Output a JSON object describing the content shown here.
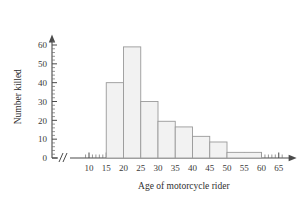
{
  "chart_data": {
    "type": "bar",
    "title": "",
    "xlabel": "Age of motorcycle rider",
    "ylabel": "Number killed",
    "categories": [
      "15-20",
      "20-25",
      "25-30",
      "30-35",
      "35-40",
      "40-45",
      "45-50",
      "50-60"
    ],
    "bins": [
      {
        "start": 15,
        "end": 20,
        "value": 40
      },
      {
        "start": 20,
        "end": 25,
        "value": 59
      },
      {
        "start": 25,
        "end": 30,
        "value": 30
      },
      {
        "start": 30,
        "end": 35,
        "value": 19.5
      },
      {
        "start": 35,
        "end": 40,
        "value": 16.5
      },
      {
        "start": 40,
        "end": 45,
        "value": 11.5
      },
      {
        "start": 45,
        "end": 50,
        "value": 8.5
      },
      {
        "start": 50,
        "end": 60,
        "value": 3
      }
    ],
    "values": [
      40,
      59,
      30,
      19.5,
      16.5,
      11.5,
      8.5,
      3
    ],
    "xlim": [
      8,
      67
    ],
    "ylim": [
      0,
      64
    ],
    "x_ticks": [
      10,
      15,
      20,
      25,
      30,
      35,
      40,
      45,
      50,
      55,
      60,
      65
    ],
    "x_tick_labels": [
      "10",
      "15",
      "20",
      "25",
      "30",
      "35",
      "40",
      "45",
      "50",
      "55",
      "60",
      "65"
    ],
    "x_minor_step": 1,
    "y_ticks": [
      0,
      10,
      20,
      30,
      40,
      50,
      60
    ],
    "y_tick_labels": [
      "0",
      "10",
      "20",
      "30",
      "40",
      "50",
      "60"
    ],
    "y_minor_step": 2,
    "grid": false,
    "legend": null,
    "axis_break_x": true,
    "bar_fill_color": "#f2f2f2",
    "bar_border_color": "#9a9a9a",
    "axis_color": "#4a4a4a"
  }
}
